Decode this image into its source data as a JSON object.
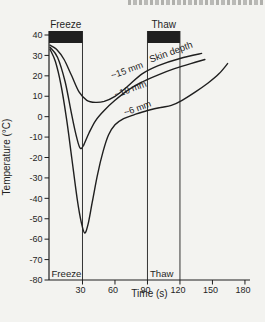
{
  "colors": {
    "ink": "#1f1f1f",
    "paper": "#f3f3f0"
  },
  "chart_data": {
    "type": "line",
    "title": "",
    "xlabel": "Time (s)",
    "ylabel": "Temperature (°C)",
    "xlim": [
      0,
      185
    ],
    "ylim": [
      -80,
      46
    ],
    "grid": false,
    "x_ticks": [
      30,
      60,
      90,
      120,
      150,
      180
    ],
    "y_ticks": [
      40,
      30,
      20,
      10,
      0,
      -10,
      -20,
      -30,
      -40,
      -50,
      -60,
      -70,
      -80
    ],
    "annotations": {
      "freeze_top_label": "Freeze",
      "thaw_top_label": "Thaw",
      "freeze_bottom_label": "Freeze",
      "thaw_bottom_label": "Thaw",
      "series_group_label": "Skin depth",
      "freeze_interval_s": [
        0,
        30
      ],
      "thaw_interval_s": [
        90,
        120
      ]
    },
    "series": [
      {
        "name": "~15 mm",
        "min_temp_c": 7,
        "points": [
          [
            0,
            35
          ],
          [
            6,
            33
          ],
          [
            13,
            28
          ],
          [
            20,
            20
          ],
          [
            27,
            12
          ],
          [
            34,
            8
          ],
          [
            42,
            7
          ],
          [
            50,
            7.5
          ],
          [
            60,
            10
          ],
          [
            72,
            15
          ],
          [
            85,
            21
          ],
          [
            100,
            25
          ],
          [
            120,
            28.5
          ],
          [
            140,
            31
          ]
        ]
      },
      {
        "name": "~10 mm",
        "min_temp_c": -16,
        "points": [
          [
            0,
            34
          ],
          [
            7,
            29
          ],
          [
            14,
            17
          ],
          [
            20,
            1
          ],
          [
            25,
            -11
          ],
          [
            28,
            -15.5
          ],
          [
            31,
            -14
          ],
          [
            36,
            -8
          ],
          [
            42,
            -2
          ],
          [
            50,
            3
          ],
          [
            60,
            8
          ],
          [
            72,
            13
          ],
          [
            85,
            17
          ],
          [
            100,
            20.5
          ],
          [
            115,
            23.5
          ],
          [
            130,
            26
          ],
          [
            143,
            28
          ]
        ]
      },
      {
        "name": "~6 mm",
        "min_temp_c": -57,
        "points": [
          [
            0,
            33
          ],
          [
            5,
            27
          ],
          [
            10,
            16
          ],
          [
            15,
            0
          ],
          [
            20,
            -20
          ],
          [
            25,
            -40
          ],
          [
            29,
            -52
          ],
          [
            32,
            -57
          ],
          [
            35,
            -53
          ],
          [
            39,
            -42
          ],
          [
            44,
            -28
          ],
          [
            49,
            -17
          ],
          [
            54,
            -9
          ],
          [
            60,
            -4
          ],
          [
            68,
            -1
          ],
          [
            78,
            1
          ],
          [
            90,
            3
          ],
          [
            102,
            4.5
          ],
          [
            112,
            5.5
          ],
          [
            122,
            8
          ],
          [
            134,
            12
          ],
          [
            146,
            16.5
          ],
          [
            156,
            21
          ],
          [
            164,
            26
          ]
        ]
      }
    ]
  }
}
